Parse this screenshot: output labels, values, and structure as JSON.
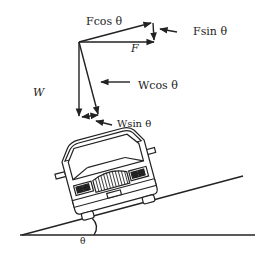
{
  "diagram": {
    "type": "force-diagram",
    "labels": {
      "f_cos": "Fcos  θ",
      "f_sin": "Fsin  θ",
      "f": "F",
      "w": "W",
      "w_cos": "Wcos θ",
      "w_sin": "Wsin θ",
      "theta": "θ"
    },
    "colors": {
      "line": "#222222",
      "background": "#ffffff"
    }
  }
}
